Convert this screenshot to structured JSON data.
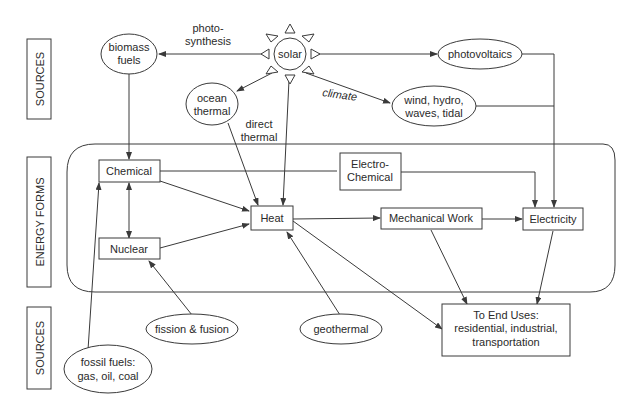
{
  "diagram": {
    "bands": {
      "sources_top": "SOURCES",
      "energy_forms": "ENERGY FORMS",
      "sources_bottom": "SOURCES"
    },
    "sources": {
      "solar": "solar",
      "biomass": [
        "biomass",
        "fuels"
      ],
      "ocean_thermal": [
        "ocean",
        "thermal"
      ],
      "photovoltaics": "photovoltaics",
      "wind": [
        "wind, hydro,",
        "waves, tidal"
      ],
      "fission": "fission & fusion",
      "geothermal": "geothermal",
      "fossil": [
        "fossil fuels:",
        "gas, oil, coal"
      ]
    },
    "edge_labels": {
      "photosynthesis": [
        "photo-",
        "synthesis"
      ],
      "direct_thermal": [
        "direct",
        "thermal"
      ],
      "climate": "climate"
    },
    "energy_forms": {
      "chemical": "Chemical",
      "electrochemical": [
        "Electro-",
        "Chemical"
      ],
      "heat": "Heat",
      "nuclear": "Nuclear",
      "mechanical": "Mechanical Work",
      "electricity": "Electricity"
    },
    "end_uses": [
      "To End Uses:",
      "residential, industrial,",
      "transportation"
    ]
  }
}
